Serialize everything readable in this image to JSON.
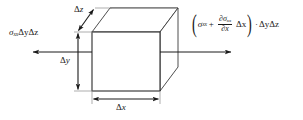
{
  "figure": {
    "type": "stress-element-diagram",
    "background_color": "#ffffff",
    "line_color": "#1a1a1a",
    "width": 303,
    "height": 120
  },
  "labels": {
    "left_stress": {
      "sigma": "σ",
      "sigma_subscript": "xx",
      "factor": "ΔyΔz",
      "full_text": "σxxΔyΔz"
    },
    "right_stress": {
      "open_paren": "(",
      "sigma": "σ",
      "sigma_subscript": "xx",
      "plus": "+",
      "numerator": "∂σ",
      "numerator_subscript": "xx",
      "denominator": "∂x",
      "delta_x": "Δx",
      "close_paren": ")",
      "dot": "·",
      "factor": "ΔyΔz",
      "full_text": "(σxx + ∂σxx/∂x Δx) · ΔyΔz"
    },
    "dim_z": {
      "delta": "Δ",
      "axis": "z",
      "full_text": "Δz"
    },
    "dim_y": {
      "delta": "Δ",
      "axis": "y",
      "full_text": "Δy"
    },
    "dim_x": {
      "delta": "Δ",
      "axis": "x",
      "full_text": "Δx"
    }
  },
  "geometry": {
    "front_face": {
      "left": 92,
      "top": 32,
      "right": 160,
      "bottom": 91
    },
    "depth_offset": {
      "dx": 18,
      "dy": -24
    },
    "arrows": {
      "left_stress_arrow": {
        "from_x": 92,
        "to_x": 31,
        "y": 52
      },
      "right_stress_arrow": {
        "from_x": 160,
        "to_x": 233,
        "y": 52
      },
      "dim_z_arrow": {
        "x1": 77,
        "y1": 32,
        "x2": 95,
        "y2": 8
      },
      "dim_y_arrow": {
        "x": 78,
        "y1": 32,
        "y2": 91
      },
      "dim_x_arrow": {
        "y": 99,
        "x1": 92,
        "x2": 160
      }
    }
  }
}
